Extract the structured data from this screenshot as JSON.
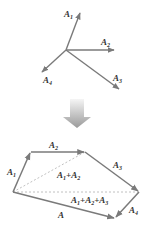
{
  "colors": {
    "vector": "#7a7a7a",
    "dashed": "#b0b0b0",
    "label": "#333333",
    "arrow_top": "#f2f2f2",
    "arrow_bottom": "#a0a0a0"
  },
  "top_figure": {
    "vectors": [
      {
        "name": "A1",
        "label": "A",
        "sub": "1"
      },
      {
        "name": "A2",
        "label": "A",
        "sub": "2"
      },
      {
        "name": "A3",
        "label": "A",
        "sub": "3"
      },
      {
        "name": "A4",
        "label": "A",
        "sub": "4"
      }
    ]
  },
  "bottom_figure": {
    "edges": [
      {
        "label": "A",
        "sub": "1"
      },
      {
        "label": "A",
        "sub": "2"
      },
      {
        "label": "A",
        "sub": "3"
      },
      {
        "label": "A",
        "sub": "4"
      }
    ],
    "partial_sum_1": {
      "parts": [
        "A",
        "1",
        "+A",
        "2"
      ]
    },
    "partial_sum_2": {
      "parts": [
        "A",
        "1",
        "+A",
        "2",
        "+A",
        "3"
      ]
    },
    "resultant": {
      "label": "A"
    }
  }
}
